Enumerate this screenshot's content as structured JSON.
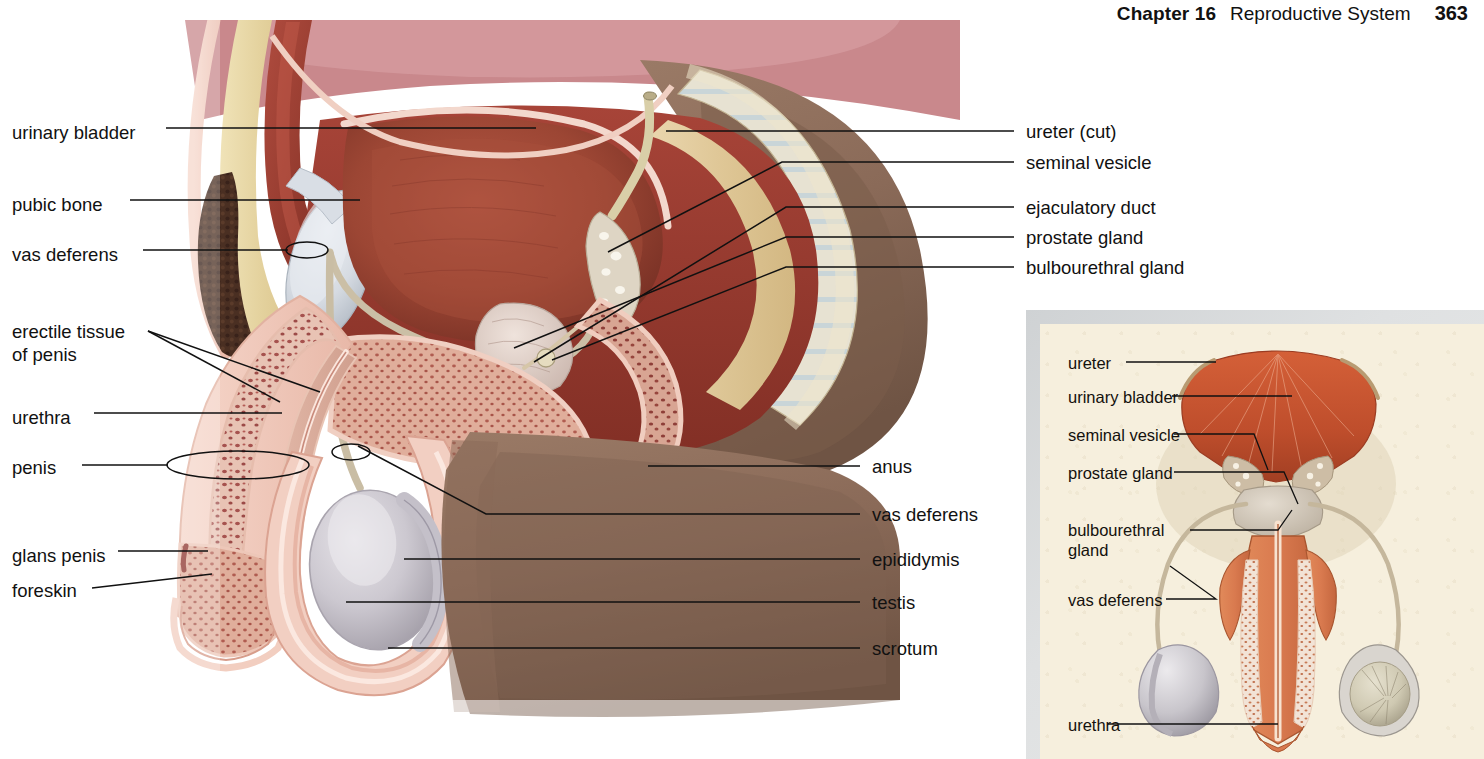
{
  "page": {
    "chapter_label": "Chapter 16",
    "section_title": "Reproductive System",
    "page_number": "363",
    "figure_type": "anatomical-illustration",
    "figure_subject": "Male reproductive system — sagittal section with anterior-view inset"
  },
  "colors": {
    "background": "#ffffff",
    "text": "#111111",
    "leader_line": "#111111",
    "inset_background": "#f6efdd",
    "inset_shadow": "#cfd2d4",
    "bladder": "#9e4637",
    "bladder_dark": "#7e3529",
    "muscle_red": "#a8453a",
    "deep_red": "#8c3127",
    "fat_cream": "#e7d8a8",
    "skin_pink": "#f0c9bd",
    "bone_grey": "#d8dde3",
    "testis_grey": "#c9c6cc",
    "thigh_brown": "#8a6a58",
    "pubic_hair": "#4a2f22",
    "erectile_speckle": "#a6524e",
    "inset_bladder": "#c4542f",
    "inset_penis": "#d97a4f"
  },
  "main_figure": {
    "labels_left": [
      {
        "id": "urinary-bladder",
        "text": "urinary bladder",
        "x": 12,
        "y": 122,
        "lines": 1
      },
      {
        "id": "pubic-bone",
        "text": "pubic bone",
        "x": 12,
        "y": 194,
        "lines": 1
      },
      {
        "id": "vas-deferens",
        "text": "vas deferens",
        "x": 12,
        "y": 244,
        "lines": 1
      },
      {
        "id": "erectile-tissue-of-penis",
        "text": "erectile tissue\nof penis",
        "x": 12,
        "y": 320,
        "lines": 2
      },
      {
        "id": "urethra",
        "text": "urethra",
        "x": 12,
        "y": 407,
        "lines": 1
      },
      {
        "id": "penis",
        "text": "penis",
        "x": 12,
        "y": 457,
        "lines": 1
      },
      {
        "id": "glans-penis",
        "text": "glans penis",
        "x": 12,
        "y": 545,
        "lines": 1
      },
      {
        "id": "foreskin",
        "text": "foreskin",
        "x": 12,
        "y": 580,
        "lines": 1
      }
    ],
    "labels_right": [
      {
        "id": "ureter-cut",
        "text": "ureter (cut)",
        "x": 1026,
        "y": 121,
        "lines": 1
      },
      {
        "id": "seminal-vesicle",
        "text": "seminal vesicle",
        "x": 1026,
        "y": 152,
        "lines": 1
      },
      {
        "id": "ejaculatory-duct",
        "text": "ejaculatory duct",
        "x": 1026,
        "y": 197,
        "lines": 1
      },
      {
        "id": "prostate-gland",
        "text": "prostate gland",
        "x": 1026,
        "y": 227,
        "lines": 1
      },
      {
        "id": "bulbourethral-gland",
        "text": "bulbourethral gland",
        "x": 1026,
        "y": 257,
        "lines": 1
      },
      {
        "id": "anus",
        "text": "anus",
        "x": 872,
        "y": 456,
        "lines": 1
      },
      {
        "id": "vas-deferens-right",
        "text": "vas deferens",
        "x": 872,
        "y": 504,
        "lines": 1
      },
      {
        "id": "epididymis",
        "text": "epididymis",
        "x": 872,
        "y": 549,
        "lines": 1
      },
      {
        "id": "testis",
        "text": "testis",
        "x": 872,
        "y": 592,
        "lines": 1
      },
      {
        "id": "scrotum",
        "text": "scrotum",
        "x": 872,
        "y": 638,
        "lines": 1
      }
    ]
  },
  "inset_figure": {
    "labels": [
      {
        "id": "inset-ureter",
        "text": "ureter",
        "x": 1068,
        "y": 354,
        "lines": 1
      },
      {
        "id": "inset-urinary-bladder",
        "text": "urinary bladder",
        "x": 1068,
        "y": 389,
        "lines": 1
      },
      {
        "id": "inset-seminal-vesicle",
        "text": "seminal vesicle",
        "x": 1068,
        "y": 428,
        "lines": 1
      },
      {
        "id": "inset-prostate-gland",
        "text": "prostate gland",
        "x": 1068,
        "y": 466,
        "lines": 1
      },
      {
        "id": "inset-bulbourethral-gland",
        "text": "bulbourethral\ngland",
        "x": 1068,
        "y": 523,
        "lines": 2
      },
      {
        "id": "inset-vas-deferens",
        "text": "vas deferens",
        "x": 1068,
        "y": 593,
        "lines": 1
      },
      {
        "id": "inset-urethra",
        "text": "urethra",
        "x": 1068,
        "y": 718,
        "lines": 1
      }
    ]
  }
}
